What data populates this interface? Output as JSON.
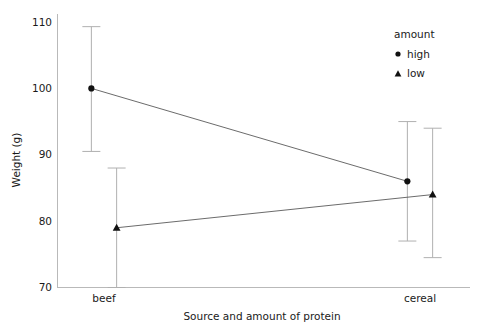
{
  "chart_data": {
    "type": "line",
    "title": "",
    "subtitle": "",
    "xlabel": "Source and amount of protein",
    "ylabel": "Weight (g)",
    "categories": [
      "beef",
      "cereal"
    ],
    "xtick_labels": [
      "beef",
      "cereal"
    ],
    "ytick_labels": [
      "70",
      "80",
      "90",
      "100",
      "110"
    ],
    "yticks": [
      70,
      80,
      90,
      100,
      110
    ],
    "ylim": [
      68,
      112
    ],
    "grid": false,
    "spines": "left-bottom",
    "legend": {
      "title": "amount",
      "position": "top-right",
      "border": false,
      "entries": [
        {
          "label": "high",
          "marker": "filled-circle"
        },
        {
          "label": "low",
          "marker": "filled-triangle"
        }
      ]
    },
    "error_bars": {
      "style": "capped-vertical",
      "color": "#b0b0b0"
    },
    "series": [
      {
        "name": "high",
        "marker": "filled-circle",
        "color": "#111111",
        "values": [
          100.0,
          86.0
        ],
        "err_low": [
          90.5,
          77.0
        ],
        "err_high": [
          109.3,
          95.0
        ]
      },
      {
        "name": "low",
        "marker": "filled-triangle",
        "color": "#111111",
        "values": [
          79.0,
          84.0
        ],
        "err_low": [
          70.0,
          74.5
        ],
        "err_high": [
          88.0,
          94.0
        ]
      }
    ],
    "series_x_offsets": [
      -0.04,
      0.04
    ]
  },
  "axis": {
    "y_title": "Weight (g)",
    "x_title": "Source and amount of protein"
  },
  "legend": {
    "title": "amount",
    "high_label": "high",
    "low_label": "low"
  },
  "ticks": {
    "y": [
      "110",
      "100",
      "90",
      "80",
      "70"
    ],
    "x": [
      "beef",
      "cereal"
    ]
  },
  "colors": {
    "marker": "#111111",
    "line": "#5a5a5a",
    "error_bar": "#b0b0b0",
    "spine": "#b9b9b9",
    "text": "#1a1a1a",
    "background": "#ffffff"
  }
}
